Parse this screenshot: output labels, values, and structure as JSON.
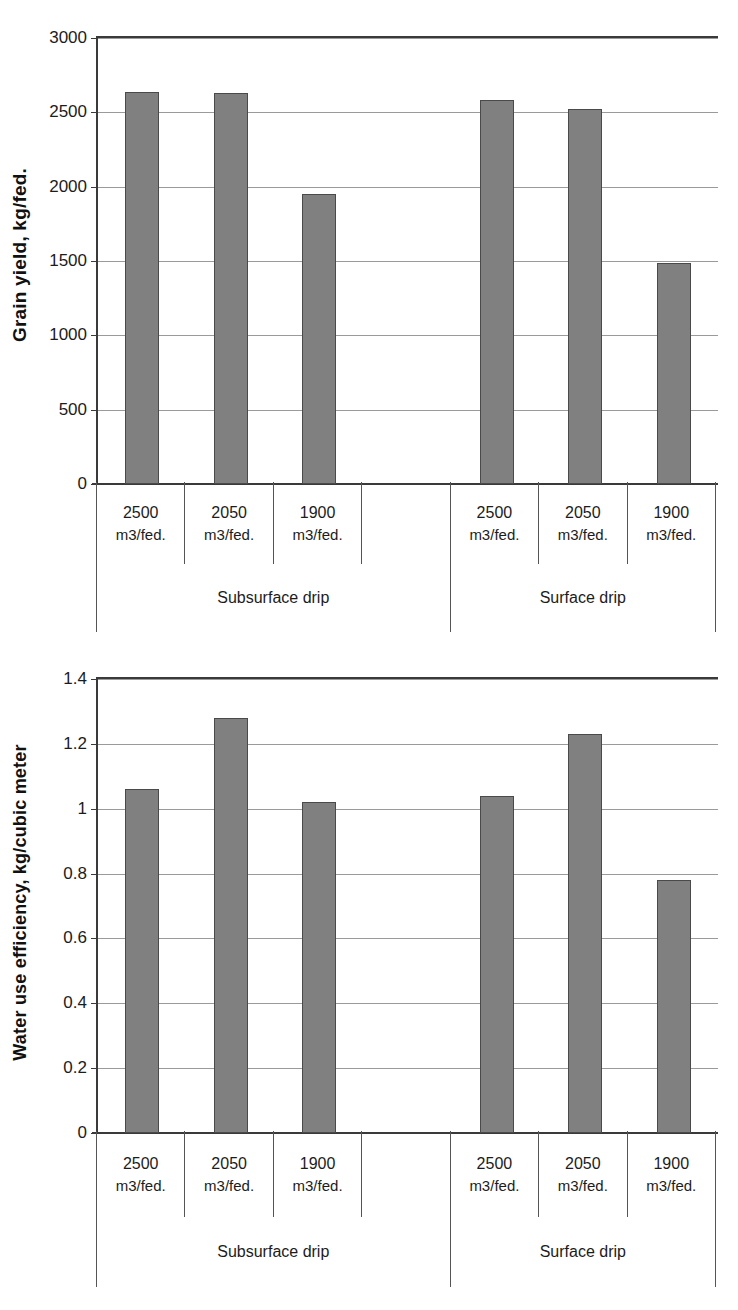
{
  "figure": {
    "background": "#ffffff",
    "bar_color": "#808080",
    "bar_edge_color": "#4a4a4a",
    "axis_color": "#3a3a3a",
    "gridline_color": "#9a9a9a"
  },
  "charts": [
    {
      "id": "grain-yield",
      "ylabel": "Grain yield, kg/fed.",
      "yticks": [
        "0",
        "500",
        "1000",
        "1500",
        "2000",
        "2500",
        "3000"
      ],
      "categories": [
        "2500",
        "2050",
        "1900",
        "",
        "2500",
        "2050",
        "1900"
      ],
      "units": [
        "m3/fed.",
        "m3/fed.",
        "m3/fed.",
        "",
        "m3/fed.",
        "m3/fed.",
        "m3/fed."
      ],
      "groups": [
        "Subsurface drip",
        "Surface drip"
      ]
    },
    {
      "id": "water-use-efficiency",
      "ylabel": "Water use efficiency, kg/cubic meter",
      "yticks": [
        "0",
        "0.2",
        "0.4",
        "0.6",
        "0.8",
        "1",
        "1.2",
        "1.4"
      ],
      "categories": [
        "2500",
        "2050",
        "1900",
        "",
        "2500",
        "2050",
        "1900"
      ],
      "units": [
        "m3/fed.",
        "m3/fed.",
        "m3/fed.",
        "",
        "m3/fed.",
        "m3/fed.",
        "m3/fed."
      ],
      "groups": [
        "Subsurface drip",
        "Surface drip"
      ]
    }
  ],
  "chart_data": [
    {
      "type": "bar",
      "title": "",
      "xlabel": "",
      "ylabel": "Grain yield, kg/fed.",
      "ylim": [
        0,
        3000
      ],
      "yticks": [
        0,
        500,
        1000,
        1500,
        2000,
        2500,
        3000
      ],
      "grid": true,
      "legend": "none",
      "categories": [
        "2500 m3/fed.",
        "2050 m3/fed.",
        "1900 m3/fed.",
        "",
        "2500 m3/fed.",
        "2050 m3/fed.",
        "1900 m3/fed."
      ],
      "groups": [
        {
          "name": "Subsurface drip",
          "categories": [
            "2500 m3/fed.",
            "2050 m3/fed.",
            "1900 m3/fed.",
            ""
          ]
        },
        {
          "name": "Surface drip",
          "categories": [
            "2500 m3/fed.",
            "2050 m3/fed.",
            "1900 m3/fed."
          ]
        }
      ],
      "values": [
        2640,
        2630,
        1950,
        null,
        2585,
        2520,
        1485
      ]
    },
    {
      "type": "bar",
      "title": "",
      "xlabel": "",
      "ylabel": "Water use efficiency, kg/cubic meter",
      "ylim": [
        0,
        1.4
      ],
      "yticks": [
        0,
        0.2,
        0.4,
        0.6,
        0.8,
        1,
        1.2,
        1.4
      ],
      "grid": true,
      "legend": "none",
      "categories": [
        "2500 m3/fed.",
        "2050 m3/fed.",
        "1900 m3/fed.",
        "",
        "2500 m3/fed.",
        "2050 m3/fed.",
        "1900 m3/fed."
      ],
      "groups": [
        {
          "name": "Subsurface drip",
          "categories": [
            "2500 m3/fed.",
            "2050 m3/fed.",
            "1900 m3/fed.",
            ""
          ]
        },
        {
          "name": "Surface drip",
          "categories": [
            "2500 m3/fed.",
            "2050 m3/fed.",
            "1900 m3/fed."
          ]
        }
      ],
      "values": [
        1.06,
        1.28,
        1.02,
        null,
        1.04,
        1.23,
        0.78
      ]
    }
  ]
}
